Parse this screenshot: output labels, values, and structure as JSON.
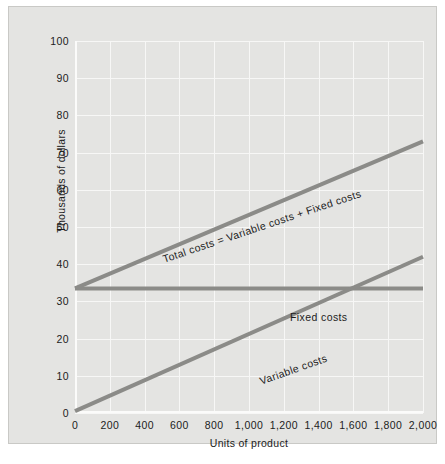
{
  "chart_data": {
    "type": "line",
    "title": "",
    "xlabel": "Units of product",
    "ylabel": "Thousands of dollars",
    "xlim": [
      0,
      2000
    ],
    "ylim": [
      0,
      100
    ],
    "grid": true,
    "legend_position": "inline-annotations",
    "xticks": [
      0,
      200,
      400,
      600,
      800,
      1000,
      1200,
      1400,
      1600,
      1800,
      2000
    ],
    "xtick_labels": [
      "0",
      "200",
      "400",
      "600",
      "800",
      "1,000",
      "1,200",
      "1,400",
      "1,600",
      "1,800",
      "2,000"
    ],
    "yticks": [
      0,
      10,
      20,
      30,
      40,
      50,
      60,
      70,
      80,
      90,
      100
    ],
    "ytick_labels": [
      "0",
      "10",
      "20",
      "30",
      "40",
      "50",
      "60",
      "70",
      "80",
      "90",
      "100"
    ],
    "series": [
      {
        "name": "Total costs = Variable costs + Fixed costs",
        "label": "Total costs = Variable costs + Fixed costs",
        "x": [
          0,
          2000
        ],
        "values": [
          33.5,
          73
        ],
        "color": "#8b8b88"
      },
      {
        "name": "Fixed costs",
        "label": "Fixed costs",
        "x": [
          0,
          2000
        ],
        "values": [
          33.5,
          33.5
        ],
        "color": "#8b8b88"
      },
      {
        "name": "Variable costs",
        "label": "Variable costs",
        "x": [
          0,
          2000
        ],
        "values": [
          0.5,
          42
        ],
        "color": "#8b8b88"
      }
    ],
    "annotations": [
      {
        "text": "Total costs = Variable costs + Fixed costs",
        "along": "total-costs"
      },
      {
        "text": "Fixed costs",
        "along": "fixed-costs"
      },
      {
        "text": "Variable costs",
        "along": "variable-costs"
      }
    ]
  },
  "colors": {
    "figure_background": "#e4e4e2",
    "page_background": "#ffffff",
    "gridline": "#f7f7f6",
    "line": "#8b8b88",
    "text": "#1c1c1c"
  }
}
